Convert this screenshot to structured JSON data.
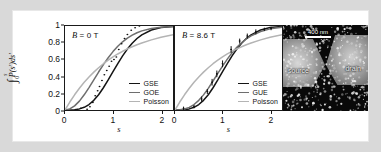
{
  "figure": {
    "background_color": "#d9d9d9",
    "panel_background": "#ffffff"
  },
  "axes": {
    "y_title_integrand": "P(s')ds'",
    "y_limit_upper": "s",
    "y_limit_lower": "0",
    "y_ticks": [
      "1",
      "0.8",
      "0.6",
      "0.4",
      "0.2",
      "0"
    ],
    "x_ticks": [
      "0",
      "1",
      "2"
    ],
    "x_title": "s"
  },
  "panels": [
    {
      "id": "b0",
      "label_symbol": "B",
      "label_text": " = 0 T",
      "legend": [
        {
          "label": "GSE",
          "color": "#141414"
        },
        {
          "label": "GOE",
          "color": "#6e6e6e"
        },
        {
          "label": "Poisson",
          "color": "#b4b4b4"
        }
      ]
    },
    {
      "id": "b86",
      "label_symbol": "B",
      "label_text": " = 8.6 T",
      "legend": [
        {
          "label": "GSE",
          "color": "#141414"
        },
        {
          "label": "GUE",
          "color": "#6e6e6e"
        },
        {
          "label": "Poisson",
          "color": "#b4b4b4"
        }
      ]
    }
  ],
  "micrograph": {
    "scalebar_label": "400 nm",
    "source_label": "source",
    "drain_label": "drain"
  },
  "chart_data": [
    {
      "type": "line",
      "id": "panel-b0",
      "title": "B = 0 T",
      "xlabel": "s",
      "ylabel": "integral from 0 to s of P(s')ds'",
      "xlim": [
        0,
        2.25
      ],
      "ylim": [
        0,
        1
      ],
      "grid": false,
      "legend_position": "lower-right",
      "series": [
        {
          "name": "GSE",
          "color": "#141414",
          "x": [
            0,
            0.1,
            0.2,
            0.3,
            0.4,
            0.5,
            0.6,
            0.7,
            0.8,
            0.9,
            1.0,
            1.1,
            1.2,
            1.3,
            1.4,
            1.5,
            1.6,
            1.8,
            2.0,
            2.25
          ],
          "y": [
            0,
            0.001,
            0.004,
            0.013,
            0.032,
            0.065,
            0.115,
            0.182,
            0.265,
            0.358,
            0.456,
            0.553,
            0.645,
            0.726,
            0.795,
            0.851,
            0.895,
            0.952,
            0.981,
            0.995
          ]
        },
        {
          "name": "GOE",
          "color": "#6e6e6e",
          "x": [
            0,
            0.1,
            0.2,
            0.3,
            0.4,
            0.5,
            0.6,
            0.7,
            0.8,
            0.9,
            1.0,
            1.1,
            1.2,
            1.3,
            1.4,
            1.5,
            1.6,
            1.8,
            2.0,
            2.25
          ],
          "y": [
            0,
            0.012,
            0.049,
            0.106,
            0.181,
            0.267,
            0.359,
            0.452,
            0.54,
            0.622,
            0.695,
            0.759,
            0.812,
            0.856,
            0.892,
            0.92,
            0.942,
            0.971,
            0.986,
            0.994
          ]
        },
        {
          "name": "Poisson",
          "color": "#b4b4b4",
          "x": [
            0,
            0.1,
            0.2,
            0.3,
            0.4,
            0.5,
            0.6,
            0.7,
            0.8,
            0.9,
            1.0,
            1.1,
            1.2,
            1.3,
            1.4,
            1.5,
            1.6,
            1.8,
            2.0,
            2.25
          ],
          "y": [
            0,
            0.095,
            0.181,
            0.259,
            0.33,
            0.393,
            0.451,
            0.503,
            0.551,
            0.593,
            0.632,
            0.667,
            0.699,
            0.727,
            0.753,
            0.777,
            0.798,
            0.835,
            0.865,
            0.895
          ]
        }
      ],
      "points": {
        "name": "measured",
        "marker": "filled-circle",
        "color": "#111111",
        "x": [
          0.33,
          0.46,
          0.52,
          0.58,
          0.63,
          0.68,
          0.72,
          0.77,
          0.82,
          0.87,
          0.92,
          0.97,
          1.02,
          1.07,
          1.12,
          1.18,
          1.24,
          1.3,
          1.38,
          1.46,
          1.55
        ],
        "y": [
          0.02,
          0.01,
          0.04,
          0.09,
          0.17,
          0.23,
          0.28,
          0.35,
          0.42,
          0.47,
          0.52,
          0.58,
          0.6,
          0.63,
          0.72,
          0.79,
          0.85,
          0.9,
          0.95,
          0.98,
          1.0
        ]
      }
    },
    {
      "type": "line",
      "id": "panel-b86",
      "title": "B = 8.6 T",
      "xlabel": "s",
      "ylabel": "integral from 0 to s of P(s')ds'",
      "xlim": [
        0,
        2.25
      ],
      "ylim": [
        0,
        1
      ],
      "grid": false,
      "legend_position": "lower-right",
      "series": [
        {
          "name": "GSE",
          "color": "#141414",
          "x": [
            0,
            0.1,
            0.2,
            0.3,
            0.4,
            0.5,
            0.6,
            0.7,
            0.8,
            0.9,
            1.0,
            1.1,
            1.2,
            1.3,
            1.4,
            1.5,
            1.6,
            1.8,
            2.0,
            2.25
          ],
          "y": [
            0,
            0.001,
            0.004,
            0.013,
            0.032,
            0.065,
            0.115,
            0.182,
            0.265,
            0.358,
            0.456,
            0.553,
            0.645,
            0.726,
            0.795,
            0.851,
            0.895,
            0.952,
            0.981,
            0.995
          ]
        },
        {
          "name": "GUE",
          "color": "#6e6e6e",
          "x": [
            0,
            0.1,
            0.2,
            0.3,
            0.4,
            0.5,
            0.6,
            0.7,
            0.8,
            0.9,
            1.0,
            1.1,
            1.2,
            1.3,
            1.4,
            1.5,
            1.6,
            1.8,
            2.0,
            2.25
          ],
          "y": [
            0,
            0.003,
            0.011,
            0.031,
            0.065,
            0.115,
            0.18,
            0.258,
            0.345,
            0.435,
            0.523,
            0.606,
            0.681,
            0.746,
            0.801,
            0.846,
            0.883,
            0.935,
            0.966,
            0.985
          ]
        },
        {
          "name": "Poisson",
          "color": "#b4b4b4",
          "x": [
            0,
            0.1,
            0.2,
            0.3,
            0.4,
            0.5,
            0.6,
            0.7,
            0.8,
            0.9,
            1.0,
            1.1,
            1.2,
            1.3,
            1.4,
            1.5,
            1.6,
            1.8,
            2.0,
            2.25
          ],
          "y": [
            0,
            0.095,
            0.181,
            0.259,
            0.33,
            0.393,
            0.451,
            0.503,
            0.551,
            0.593,
            0.632,
            0.667,
            0.699,
            0.727,
            0.753,
            0.777,
            0.798,
            0.835,
            0.865,
            0.895
          ]
        }
      ],
      "points": {
        "name": "measured",
        "marker": "filled-circle-errorbar",
        "color": "#111111",
        "x": [
          0.18,
          0.4,
          0.56,
          0.68,
          0.78,
          0.88,
          1.0,
          1.18,
          1.36,
          1.52,
          1.7,
          1.88,
          2.02
        ],
        "y": [
          0.02,
          0.04,
          0.13,
          0.22,
          0.33,
          0.43,
          0.55,
          0.72,
          0.82,
          0.88,
          0.93,
          0.96,
          0.97
        ],
        "yerr": [
          0.02,
          0.02,
          0.03,
          0.03,
          0.04,
          0.04,
          0.04,
          0.04,
          0.03,
          0.03,
          0.03,
          0.02,
          0.02
        ]
      }
    }
  ]
}
